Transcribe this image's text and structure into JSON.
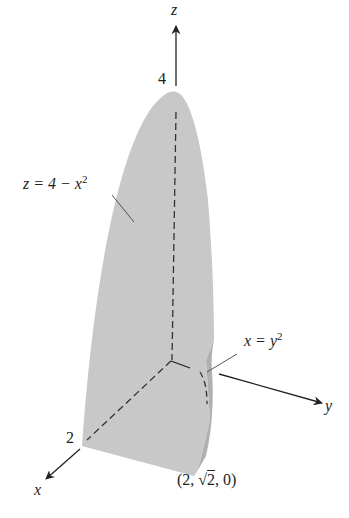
{
  "figure": {
    "axes": {
      "x": {
        "label": "x",
        "tick_label": "2"
      },
      "y": {
        "label": "y"
      },
      "z": {
        "label": "z",
        "tick_label": "4"
      }
    },
    "surfaces": [
      {
        "id": "parabolic-cylinder",
        "equation_lhs": "z = 4 − x",
        "equation_exp": "2"
      },
      {
        "id": "parabolic-wall",
        "equation_lhs": "x = y",
        "equation_exp": "2"
      }
    ],
    "point_label": {
      "prefix": "(2, ",
      "sqrt_arg": "2",
      "suffix": ", 0)"
    },
    "colors": {
      "solid_fill": "#c8c8c8",
      "solid_side": "#b4b4b4",
      "axis": "#222222",
      "dashed": "#333333",
      "background": "#ffffff"
    }
  }
}
